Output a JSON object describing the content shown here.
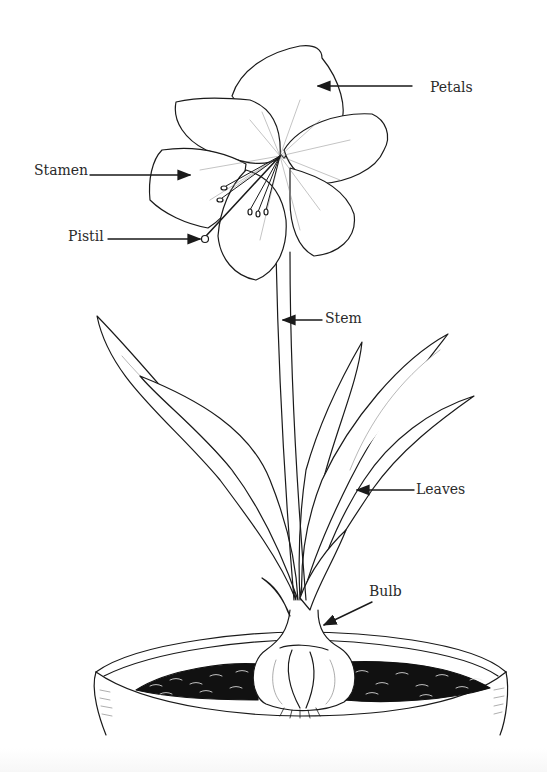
{
  "diagram": {
    "style": "black-and-white line drawing",
    "colors": {
      "ink": "#1a1a1a",
      "paper": "#ffffff",
      "soil": "#111111"
    },
    "labels": [
      {
        "id": "petals",
        "text": "Petals",
        "x": 430,
        "y": 80,
        "arrow_from": [
          412,
          86
        ],
        "arrow_to": [
          318,
          86
        ]
      },
      {
        "id": "stamen",
        "text": "Stamen",
        "x": 34,
        "y": 162,
        "arrow_from": [
          90,
          175
        ],
        "arrow_to": [
          190,
          175
        ]
      },
      {
        "id": "pistil",
        "text": "Pistil",
        "x": 68,
        "y": 228,
        "arrow_from": [
          108,
          239
        ],
        "arrow_to": [
          202,
          239
        ]
      },
      {
        "id": "stem",
        "text": "Stem",
        "x": 325,
        "y": 310,
        "arrow_from": [
          322,
          320
        ],
        "arrow_to": [
          283,
          320
        ]
      },
      {
        "id": "leaves",
        "text": "Leaves",
        "x": 416,
        "y": 483,
        "arrow_from": [
          414,
          490
        ],
        "arrow_to": [
          357,
          490
        ]
      },
      {
        "id": "bulb",
        "text": "Bulb",
        "x": 369,
        "y": 585,
        "arrow_from": [
          372,
          602
        ],
        "arrow_to": [
          324,
          625
        ]
      }
    ]
  }
}
